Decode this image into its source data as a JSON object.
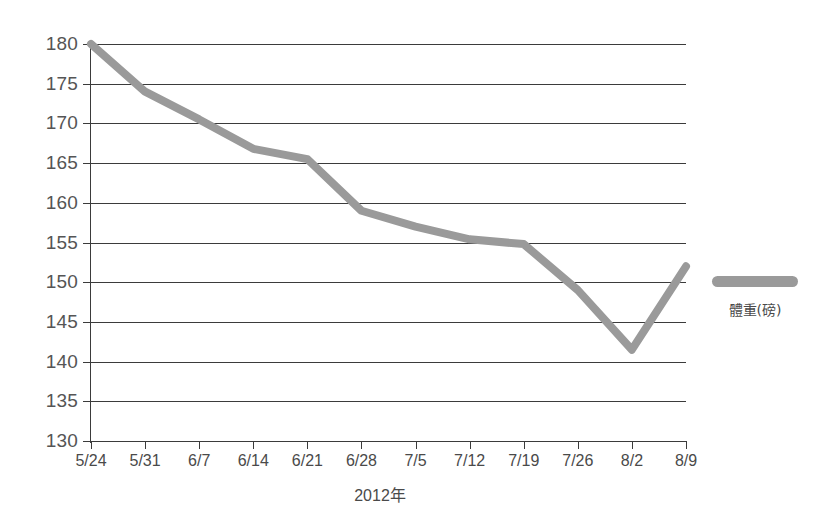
{
  "chart_data": {
    "type": "line",
    "title": "",
    "xlabel": "2012年",
    "ylabel": "",
    "categories": [
      "5/24",
      "5/31",
      "6/7",
      "6/14",
      "6/21",
      "6/28",
      "7/5",
      "7/12",
      "7/19",
      "7/26",
      "8/2",
      "8/9"
    ],
    "series": [
      {
        "name": "體重(磅)",
        "color": "#9a9a9a",
        "values": [
          180,
          174,
          170.5,
          166.8,
          165.5,
          159,
          157,
          155.4,
          154.8,
          149,
          141.5,
          152
        ]
      }
    ],
    "ylim": [
      130,
      180
    ],
    "yticks": [
      130,
      135,
      140,
      145,
      150,
      155,
      160,
      165,
      170,
      175,
      180
    ],
    "ytick_labels": [
      "130",
      "135",
      "140",
      "145",
      "150",
      "155",
      "160",
      "165",
      "170",
      "175",
      "180"
    ],
    "grid": true,
    "grid_axis": "y",
    "legend_position": "right",
    "line_width_px": 8,
    "background": "#ffffff",
    "axis_color": "#3b3b3b",
    "tick_label_color": "#555555"
  },
  "legend": {
    "swatch_name": "weight-series-swatch",
    "label": "體重(磅)"
  },
  "axes": {
    "x_title": "2012年"
  }
}
